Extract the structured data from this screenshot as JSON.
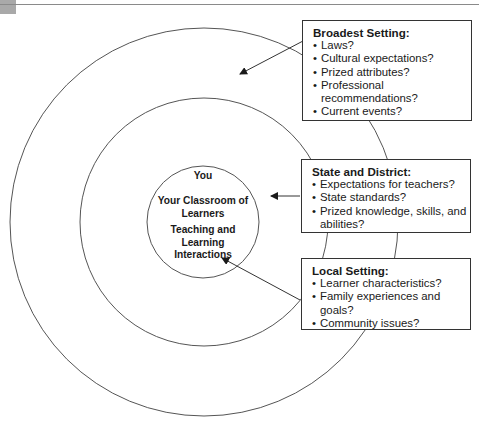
{
  "diagram": {
    "center": {
      "you": "You",
      "classroom": [
        "Your Classroom of",
        "Learners"
      ],
      "teaching": [
        "Teaching and",
        "Learning",
        "Interactions"
      ]
    },
    "boxes": [
      {
        "title": "Broadest Setting:",
        "items": [
          "Laws?",
          "Cultural expectations?",
          "Prized attributes?",
          "Professional recommendations?",
          "Current events?"
        ]
      },
      {
        "title": "State and District:",
        "items": [
          "Expectations for teachers?",
          "State standards?",
          "Prized knowledge, skills, and abilities?"
        ]
      },
      {
        "title": "Local Setting:",
        "items": [
          "Learner characteristics?",
          "Family experiences and goals?",
          "Community issues?"
        ]
      }
    ],
    "colors": {
      "line": "#555555",
      "text": "#1a1a1a"
    }
  }
}
